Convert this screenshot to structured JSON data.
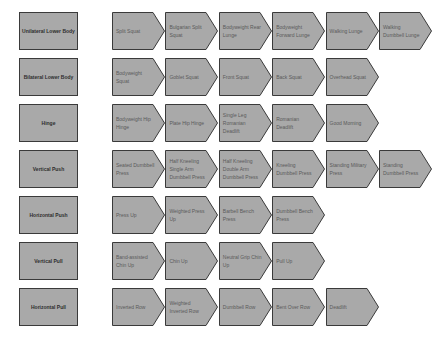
{
  "colors": {
    "shape_fill": "#a9a9a9",
    "shape_border": "#3a3a3a",
    "label_text": "#2e2e2e",
    "step_text": "#5a5a5a",
    "background": "#ffffff"
  },
  "rows": [
    {
      "category": "Unilateral Lower Body",
      "steps": [
        "Split Squat",
        "Bulgarian Split Squat",
        "Bodyweight Rear Lunge",
        "Bodyweight Forward Lunge",
        "Walking Lunge",
        "Walking Dumbbell Lunge"
      ]
    },
    {
      "category": "Bilateral Lower Body",
      "steps": [
        "Bodyweight Squat",
        "Goblet Squat",
        "Front Squat",
        "Back Squat",
        "Overhead Squat"
      ]
    },
    {
      "category": "Hinge",
      "steps": [
        "Bodyweight Hip Hinge",
        "Plate Hip Hinge",
        "Single Leg Romanian Deadlift",
        "Romanian Deadlift",
        "Good Morning"
      ]
    },
    {
      "category": "Vertical Push",
      "steps": [
        "Seated Dumbbell Press",
        "Half Kneeling Single Arm Dumbbell Press",
        "Half Kneeling Double Arm Dumbbell Press",
        "Kneeling Dumbbell Press",
        "Standing Military Press",
        "Standing Dumbbell Press"
      ]
    },
    {
      "category": "Horizontal Push",
      "steps": [
        "Press Up",
        "Weighted Press Up",
        "Barbell Bench Press",
        "Dumbbell Bench Press"
      ]
    },
    {
      "category": "Vertical Pull",
      "steps": [
        "Band-assisted Chin Up",
        "Chin Up",
        "Neutral Grip Chin Up",
        "Pull Up"
      ]
    },
    {
      "category": "Horizontal Pull",
      "steps": [
        "Inverted Row",
        "Weighted Inverted Row",
        "Dumbbell Row",
        "Bent Over Row",
        "Deadlift"
      ]
    }
  ]
}
